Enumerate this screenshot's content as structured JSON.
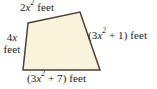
{
  "figure": {
    "kind": "geometry-diagram",
    "background_color": "#ffffff",
    "shape": {
      "name": "quadrilateral",
      "fill_color": "#faf3dc",
      "stroke_color": "#4a4038",
      "stroke_width": 1.5,
      "points": "28,23 80,12 100,70 23,70"
    }
  },
  "labels": {
    "top": {
      "coefficient": "2",
      "variable": "x",
      "exponent": "2",
      "unit": "feet",
      "full_text": "2x² feet"
    },
    "left": {
      "line1": "4x",
      "line1_coefficient": "4",
      "line1_variable": "x",
      "line2": "feet",
      "full_text": "4x feet"
    },
    "right": {
      "open_paren": "(",
      "coefficient": "3",
      "variable": "x",
      "exponent": "2",
      "operator": "+",
      "constant": "1",
      "close_paren": ")",
      "unit": "feet",
      "full_text": "(3x² + 1) feet"
    },
    "bottom": {
      "open_paren": "(",
      "coefficient": "3",
      "variable": "x",
      "exponent": "2",
      "operator": "+",
      "constant": "7",
      "close_paren": ")",
      "unit": "feet",
      "full_text": "(3x² + 7) feet"
    }
  }
}
